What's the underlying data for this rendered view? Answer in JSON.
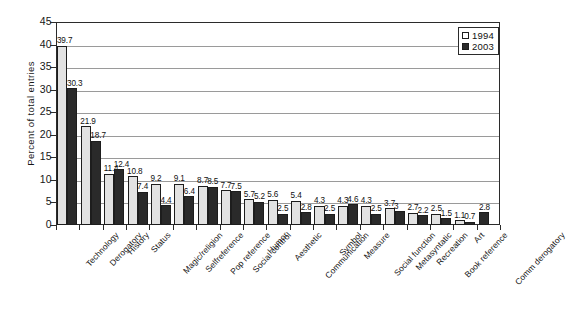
{
  "chart_data": {
    "type": "bar",
    "title": "",
    "xlabel": "",
    "ylabel": "Percent of total entries",
    "ylim": [
      0,
      45
    ],
    "ytick_step": 5,
    "ytick_labels": [
      "0",
      "5",
      "10",
      "15",
      "20",
      "25",
      "30",
      "35",
      "40",
      "45"
    ],
    "grid": true,
    "legend_position": "top-right",
    "categories": [
      "Technology",
      "Derogatory",
      "History",
      "Status",
      "Magic/religion",
      "Selfreference",
      "Pop reference",
      "Social control",
      "Humor",
      "Aesthetic",
      "Communication",
      "Symbol",
      "Measure",
      "Social function",
      "Metasyntatic",
      "Recreation",
      "Book reference",
      "Art",
      "Comm derogatory"
    ],
    "series": [
      {
        "name": "1994",
        "color": "#e2e2e2",
        "values": [
          39.7,
          21.9,
          11.4,
          10.8,
          9.2,
          9.1,
          8.7,
          7.7,
          5.7,
          5.6,
          5.4,
          4.3,
          4.3,
          4.3,
          3.7,
          2.7,
          2.5,
          1.1,
          null
        ]
      },
      {
        "name": "2003",
        "color": "#2a2a2a",
        "values": [
          30.3,
          18.7,
          12.4,
          7.4,
          4.4,
          6.4,
          8.5,
          7.5,
          5.2,
          2.5,
          2.8,
          2.5,
          4.6,
          2.5,
          3.0,
          2.2,
          1.5,
          0.7,
          2.8
        ]
      }
    ],
    "data_labels": {
      "1994": [
        "39.7",
        "21.9",
        "11.4",
        "10.8",
        "9.2",
        "9.1",
        "8.7",
        "7.7",
        "5.7",
        "5.6",
        "5.4",
        "4.3",
        "4.3",
        "4.3",
        "3.7",
        "2.7",
        "2.5",
        "1.1",
        ""
      ],
      "2003": [
        "30.3",
        "18.7",
        "12.4",
        "7.4",
        "4.4",
        "6.4",
        "8.5",
        "7.5",
        "5.2",
        "2.5",
        "2.8",
        "2.5",
        "4.6",
        "2.5",
        "3",
        "2.2",
        "1.5",
        "0.7",
        "2.8"
      ]
    }
  },
  "legend": {
    "entries": [
      {
        "label": "1994",
        "swatch": "open-square"
      },
      {
        "label": "2003",
        "swatch": "filled-square"
      }
    ]
  }
}
